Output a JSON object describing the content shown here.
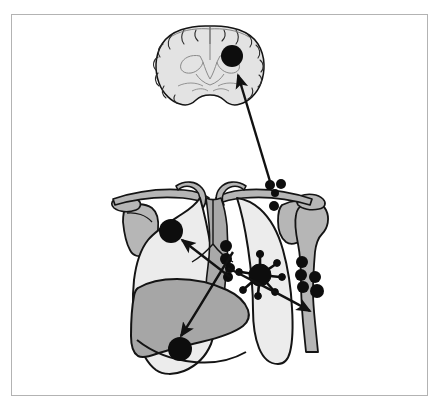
{
  "figure": {
    "domain": "medical-illustration",
    "frame": {
      "x": 11,
      "y": 14,
      "width": 417,
      "height": 382,
      "border_color": "#b3b3b3",
      "background": "#ffffff"
    },
    "palette": {
      "outline": "#111111",
      "lesion_fill": "#0d0d0d",
      "lung_fill": "#ececec",
      "bone_fill": "#b6b6b6",
      "liver_fill": "#a6a6a6",
      "brain_fill": "#e3e3e3",
      "mediastinum_fill": "#a9a9a9",
      "page_background": "#ffffff"
    },
    "panels": [
      {
        "name": "brain-coronal-section",
        "label": "Coronal section of brain",
        "center": [
          210,
          66
        ],
        "description": "Coronal brain slice with cortical sulci, lateral ventricles and a solitary dark metastatic deposit in the right cerebral hemisphere"
      },
      {
        "name": "thorax-panel",
        "label": "Thorax with lungs, shoulder girdle and liver",
        "center": [
          222,
          275
        ],
        "description": "Anterior view of thorax showing both lungs, clavicles, scapulae, proximal humerus, mediastinum and liver"
      }
    ],
    "lesions": [
      {
        "id": "brain-metastasis",
        "label": "Cerebral metastasis",
        "type": "solid-nodule",
        "cx": 232,
        "cy": 56,
        "r": 11
      },
      {
        "id": "primary-tumour",
        "label": "Primary bronchogenic carcinoma",
        "type": "spiculated-mass",
        "cx": 260,
        "cy": 275,
        "r": 11,
        "spicule_count": 7
      },
      {
        "id": "contralateral-lung-metastasis",
        "label": "Contralateral pulmonary metastasis",
        "type": "solid-nodule",
        "cx": 171,
        "cy": 231,
        "r": 12
      },
      {
        "id": "liver-metastasis",
        "label": "Hepatic metastasis",
        "type": "solid-nodule",
        "cx": 180,
        "cy": 349,
        "r": 12
      }
    ],
    "node_chains": [
      {
        "id": "supraclavicular-nodes",
        "label": "Supraclavicular lymph nodes",
        "nodes": [
          {
            "cx": 270,
            "cy": 185,
            "r": 5
          },
          {
            "cx": 281,
            "cy": 184,
            "r": 5
          },
          {
            "cx": 275,
            "cy": 193,
            "r": 4
          },
          {
            "cx": 274,
            "cy": 206,
            "r": 5
          }
        ]
      },
      {
        "id": "hilar-mediastinal-nodes",
        "label": "Hilar and mediastinal lymph nodes",
        "nodes": [
          {
            "cx": 226,
            "cy": 246,
            "r": 6
          },
          {
            "cx": 226,
            "cy": 259,
            "r": 6
          },
          {
            "cx": 230,
            "cy": 268,
            "r": 5
          },
          {
            "cx": 228,
            "cy": 277,
            "r": 5
          }
        ]
      },
      {
        "id": "humeral-bone-metastases",
        "label": "Osseous metastases in humerus",
        "nodes": [
          {
            "cx": 302,
            "cy": 262,
            "r": 6
          },
          {
            "cx": 301,
            "cy": 275,
            "r": 6
          },
          {
            "cx": 303,
            "cy": 287,
            "r": 6
          },
          {
            "cx": 315,
            "cy": 277,
            "r": 6
          },
          {
            "cx": 317,
            "cy": 291,
            "r": 7
          }
        ]
      }
    ],
    "arrows": [
      {
        "id": "arrow-to-brain",
        "label": "Haematogenous spread to brain",
        "from": [
          272,
          188
        ],
        "to": [
          236,
          72
        ]
      },
      {
        "id": "arrow-to-contralateral-lung",
        "label": "Spread to contralateral lung",
        "from": [
          228,
          276
        ],
        "to": [
          180,
          239
        ]
      },
      {
        "id": "arrow-to-liver",
        "label": "Spread to liver",
        "from": [
          233,
          252
        ],
        "to": [
          179,
          337
        ]
      },
      {
        "id": "arrow-to-bone",
        "label": "Spread to bone",
        "from": [
          228,
          268
        ],
        "to": [
          312,
          310
        ]
      }
    ]
  }
}
